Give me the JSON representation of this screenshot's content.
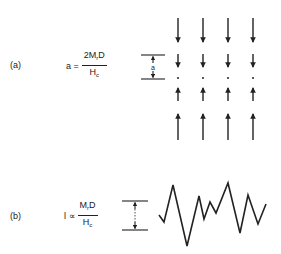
{
  "panel_a": {
    "label": "(a)",
    "equation": {
      "lhs": "a =",
      "numerator_pre": "2M",
      "numerator_sub": "r",
      "numerator_post": "D",
      "denominator_main": "H",
      "denominator_sub": "c"
    },
    "dimension_label": "a",
    "arrow_columns_x": [
      178,
      203,
      228,
      253
    ],
    "rows": [
      {
        "type": "long-down"
      },
      {
        "type": "short-down"
      },
      {
        "type": "dot"
      },
      {
        "type": "short-up"
      },
      {
        "type": "long-up"
      }
    ]
  },
  "panel_b": {
    "label": "(b)",
    "equation": {
      "lhs": "l ∝",
      "numerator_pre": "M",
      "numerator_sub": "r",
      "numerator_post": "D",
      "denominator_main": "H",
      "denominator_sub": "c"
    },
    "dimension_label": "l",
    "zigzag_points": "159,215 164,222 173,185 187,246 199,196 204,219 210,202 216,213 228,183 240,233 248,195 258,224 266,204"
  },
  "colors": {
    "ink": "#222222",
    "background": "#ffffff"
  }
}
